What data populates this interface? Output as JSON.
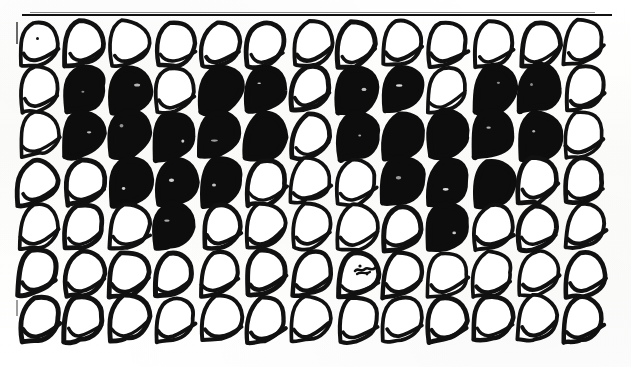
{
  "figure": {
    "medium": "scanned line drawing, black ink on white paper",
    "rows": 7,
    "columns": 13,
    "shape_name": "teardrop",
    "colors": {
      "ink": "#111111",
      "fill_black": "#0d0d0d",
      "fill_white": "#ffffff",
      "paper": "#fdfdfb"
    },
    "marks": {
      "top_rule": "horizontal-rule",
      "left_rule": "vertical-rule",
      "speck_row1": "ink-speck",
      "scribble_row6": "ink-scribble"
    }
  },
  "chart_data": {
    "type": "heatmap",
    "xlabel": "",
    "ylabel": "",
    "columns": [
      "1",
      "2",
      "3",
      "4",
      "5",
      "6",
      "7",
      "8",
      "9",
      "10",
      "11",
      "12",
      "13"
    ],
    "rows": [
      "1",
      "2",
      "3",
      "4",
      "5",
      "6",
      "7"
    ],
    "legend": [
      "outline (white)",
      "filled (black)"
    ],
    "values": [
      [
        0,
        0,
        0,
        0,
        0,
        0,
        0,
        0,
        0,
        0,
        0,
        0,
        0
      ],
      [
        0,
        1,
        1,
        0,
        1,
        1,
        0,
        1,
        1,
        0,
        1,
        1,
        0
      ],
      [
        0,
        1,
        1,
        1,
        1,
        1,
        0,
        1,
        1,
        1,
        1,
        1,
        0
      ],
      [
        0,
        0,
        1,
        1,
        1,
        0,
        0,
        0,
        1,
        1,
        1,
        0,
        0
      ],
      [
        0,
        0,
        0,
        1,
        0,
        0,
        0,
        0,
        0,
        1,
        0,
        0,
        0
      ],
      [
        0,
        0,
        0,
        0,
        0,
        0,
        0,
        0,
        0,
        0,
        0,
        0,
        0
      ],
      [
        0,
        0,
        0,
        0,
        0,
        0,
        0,
        0,
        0,
        0,
        0,
        0,
        0
      ]
    ],
    "filled_count": 34,
    "total_count": 91,
    "grid": false,
    "legend_position": "none"
  },
  "geometry": {
    "origin_x": 14,
    "origin_y": 16,
    "cell_w": 45.5,
    "cell_h": 46.0,
    "shape_w": 44,
    "shape_h": 50
  }
}
